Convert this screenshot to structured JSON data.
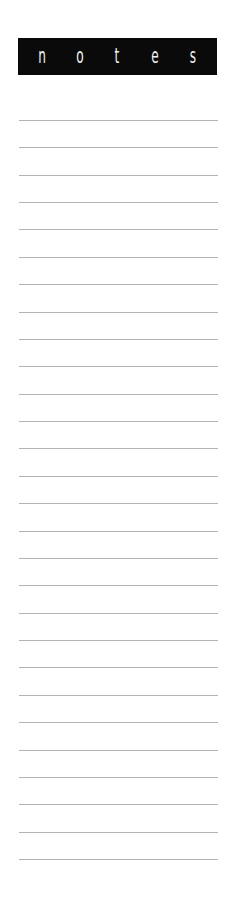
{
  "header": {
    "letters": [
      "n",
      "o",
      "t",
      "e",
      "s"
    ],
    "background_color": "#0a0a0a",
    "text_color": "#f2f2f2"
  },
  "ruled_lines": {
    "count": 28,
    "first_y": 120,
    "spacing": 27.37,
    "color": "#b4b4b4"
  }
}
